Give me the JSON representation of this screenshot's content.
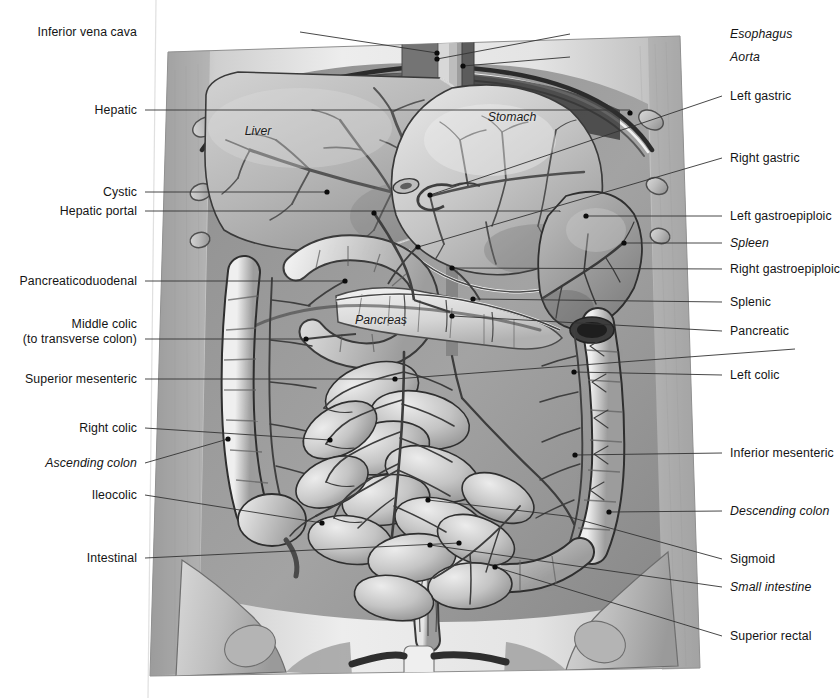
{
  "figure": {
    "background_color": "#ffffff",
    "label_color": "#141414",
    "leader_color": "#333333",
    "width": 836,
    "height": 698
  },
  "organ_labels": [
    {
      "name": "liver",
      "text": "Liver",
      "x": 258,
      "y": 131,
      "italic": true
    },
    {
      "name": "stomach",
      "text": "Stomach",
      "x": 512,
      "y": 117,
      "italic": true
    },
    {
      "name": "pancreas",
      "text": "Pancreas",
      "x": 381,
      "y": 320,
      "italic": true
    }
  ],
  "left_labels": [
    {
      "name": "inferior-vena-cava",
      "text": "Inferior vena cava",
      "y": 32,
      "italic": false,
      "leader": [
        [
          300,
          32
        ],
        [
          437,
          53
        ]
      ],
      "dot": [
        437,
        53
      ]
    },
    {
      "name": "hepatic",
      "text": "Hepatic",
      "y": 110,
      "italic": false,
      "leader": [
        [
          145,
          110
        ],
        [
          630,
          110
        ],
        [
          630,
          113
        ]
      ],
      "dot": [
        630,
        113
      ]
    },
    {
      "name": "cystic",
      "text": "Cystic",
      "y": 192,
      "italic": false,
      "leader": [
        [
          145,
          192
        ],
        [
          327,
          192
        ]
      ],
      "dot": [
        327,
        192
      ]
    },
    {
      "name": "hepatic-portal",
      "text": "Hepatic portal",
      "y": 211,
      "italic": false,
      "leader": [
        [
          145,
          211
        ],
        [
          560,
          211
        ],
        [
          560,
          212
        ]
      ],
      "dot": [
        374,
        213
      ]
    },
    {
      "name": "pancreaticoduodenal",
      "text": "Pancreaticoduodenal",
      "y": 281,
      "italic": false,
      "leader": [
        [
          145,
          281
        ],
        [
          345,
          281
        ]
      ],
      "dot": [
        345,
        281
      ]
    },
    {
      "name": "middle-colic",
      "text": "Middle colic",
      "text2": "(to transverse colon)",
      "y": 339,
      "italic": false,
      "leader": [
        [
          145,
          339
        ],
        [
          306,
          339
        ]
      ],
      "dot": [
        306,
        339
      ]
    },
    {
      "name": "superior-mesenteric",
      "text": "Superior mesenteric",
      "y": 379,
      "italic": false,
      "leader": [
        [
          145,
          379
        ],
        [
          395,
          379
        ],
        [
          795,
          349
        ]
      ],
      "dot": [
        395,
        379
      ]
    },
    {
      "name": "right-colic",
      "text": "Right colic",
      "y": 428,
      "italic": false,
      "leader": [
        [
          145,
          428
        ],
        [
          330,
          440
        ]
      ],
      "dot": [
        330,
        440
      ]
    },
    {
      "name": "ascending-colon",
      "text": "Ascending colon",
      "y": 463,
      "italic": true,
      "leader": [
        [
          145,
          463
        ],
        [
          228,
          439
        ]
      ],
      "dot": [
        228,
        439
      ]
    },
    {
      "name": "ileocolic",
      "text": "Ileocolic",
      "y": 495,
      "italic": false,
      "leader": [
        [
          145,
          495
        ],
        [
          322,
          523
        ]
      ],
      "dot": [
        322,
        523
      ]
    },
    {
      "name": "intestinal",
      "text": "Intestinal",
      "y": 558,
      "italic": false,
      "leader": [
        [
          145,
          558
        ],
        [
          459,
          543
        ]
      ],
      "dot": [
        459,
        543
      ]
    }
  ],
  "right_labels": [
    {
      "name": "esophagus",
      "text": "Esophagus",
      "y": 34,
      "italic": true,
      "leader": [
        [
          570,
          34
        ],
        [
          437,
          59
        ]
      ],
      "dot": [
        437,
        59
      ]
    },
    {
      "name": "aorta",
      "text": "Aorta",
      "y": 57,
      "italic": true,
      "leader": [
        [
          570,
          57
        ],
        [
          463,
          66
        ]
      ],
      "dot": [
        463,
        66
      ]
    },
    {
      "name": "left-gastric",
      "text": "Left gastric",
      "y": 96,
      "italic": false,
      "leader": [
        [
          722,
          96
        ],
        [
          430,
          195
        ]
      ],
      "dot": [
        430,
        195
      ]
    },
    {
      "name": "right-gastric",
      "text": "Right gastric",
      "y": 158,
      "italic": false,
      "leader": [
        [
          722,
          158
        ],
        [
          418,
          247
        ]
      ],
      "dot": [
        418,
        247
      ]
    },
    {
      "name": "left-gastroepiploic",
      "text": "Left gastroepiploic",
      "y": 216,
      "italic": false,
      "leader": [
        [
          722,
          216
        ],
        [
          586,
          216
        ]
      ],
      "dot": [
        586,
        216
      ]
    },
    {
      "name": "spleen",
      "text": "Spleen",
      "y": 243,
      "italic": true,
      "leader": [
        [
          722,
          243
        ],
        [
          624,
          243
        ]
      ],
      "dot": [
        624,
        243
      ]
    },
    {
      "name": "right-gastroepiploic",
      "text": "Right gastroepiploic",
      "y": 269,
      "italic": false,
      "leader": [
        [
          722,
          269
        ],
        [
          452,
          268
        ]
      ],
      "dot": [
        452,
        268
      ]
    },
    {
      "name": "splenic",
      "text": "Splenic",
      "y": 302,
      "italic": false,
      "leader": [
        [
          722,
          302
        ],
        [
          473,
          299
        ]
      ],
      "dot": [
        473,
        299
      ]
    },
    {
      "name": "pancreatic",
      "text": "Pancreatic",
      "y": 331,
      "italic": false,
      "leader": [
        [
          722,
          331
        ],
        [
          452,
          316
        ]
      ],
      "dot": [
        452,
        316
      ]
    },
    {
      "name": "left-colic",
      "text": "Left colic",
      "y": 375,
      "italic": false,
      "leader": [
        [
          722,
          375
        ],
        [
          574,
          372
        ]
      ],
      "dot": [
        574,
        372
      ]
    },
    {
      "name": "inferior-mesenteric",
      "text": "Inferior mesenteric",
      "y": 453,
      "italic": false,
      "leader": [
        [
          722,
          453
        ],
        [
          575,
          455
        ]
      ],
      "dot": [
        575,
        455
      ]
    },
    {
      "name": "descending-colon",
      "text": "Descending colon",
      "y": 511,
      "italic": true,
      "leader": [
        [
          722,
          511
        ],
        [
          609,
          512
        ]
      ],
      "dot": [
        609,
        512
      ]
    },
    {
      "name": "sigmoid",
      "text": "Sigmoid",
      "y": 559,
      "italic": false,
      "leader": [
        [
          722,
          559
        ],
        [
          566,
          516
        ],
        [
          428,
          500
        ]
      ],
      "dot": [
        428,
        500
      ]
    },
    {
      "name": "small-intestine",
      "text": "Small intestine",
      "y": 587,
      "italic": true,
      "leader": [
        [
          722,
          587
        ],
        [
          430,
          545
        ]
      ],
      "dot": [
        430,
        545
      ]
    },
    {
      "name": "superior-rectal",
      "text": "Superior rectal",
      "y": 636,
      "italic": false,
      "leader": [
        [
          722,
          636
        ],
        [
          495,
          567
        ]
      ],
      "dot": [
        495,
        567
      ]
    }
  ]
}
